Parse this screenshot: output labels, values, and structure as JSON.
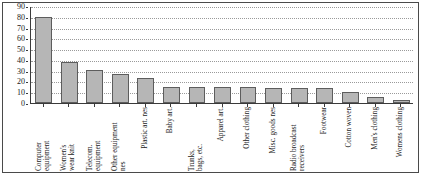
{
  "chart_data": {
    "type": "bar",
    "title": "",
    "subtitle": "",
    "xlabel": "",
    "ylabel": "",
    "ylim": [
      0,
      90
    ],
    "ytick_step": 10,
    "yticks": [
      0,
      10,
      20,
      30,
      40,
      50,
      60,
      70,
      80,
      90
    ],
    "grid": true,
    "legend": null,
    "bar_color": "#b6b6b6",
    "bar_edge_color": "#5d5d5d",
    "axis_color": "#3a3a3a",
    "gridline_color": "#9a9a9a",
    "categories": [
      "Computer equipment",
      "Women's wear knit",
      "Telecom. equipment",
      "Other equipment nes",
      "Plastic art. nes",
      "Baby art.",
      "Trunks, bags, etc.",
      "Apparel art.",
      "Other clothing",
      "Misc. goods nes",
      "Radio broadcast receivers",
      "Footwear",
      "Cotton woven",
      "Men's clothing",
      "Womens clothing"
    ],
    "category_lines": [
      [
        "Computer",
        "equipment"
      ],
      [
        "Women's",
        "wear knit"
      ],
      [
        "Telecom.",
        "equipment"
      ],
      [
        "Other equipment",
        "nes"
      ],
      [
        "Plastic art. nes"
      ],
      [
        "Baby art."
      ],
      [
        "Trunks,",
        "bags, etc."
      ],
      [
        "Apparel art."
      ],
      [
        "Other clothing"
      ],
      [
        "Misc. goods nes"
      ],
      [
        "Radio broadcast",
        "receivers"
      ],
      [
        "Footwear"
      ],
      [
        "Cotton woven"
      ],
      [
        "Men's clothing"
      ],
      [
        "Womens clothing"
      ]
    ],
    "values": [
      80,
      38,
      31,
      27,
      23,
      15,
      15,
      15,
      15,
      14,
      14,
      14,
      10,
      6,
      3
    ]
  }
}
